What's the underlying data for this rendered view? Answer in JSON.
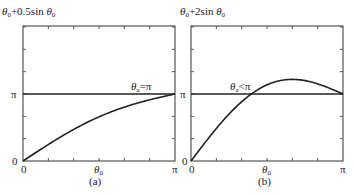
{
  "chart_data": [
    {
      "type": "line",
      "panel_label": "(a)",
      "title": "θ0+0.5sin θ0",
      "xlabel": "θ0",
      "x_tick_labels": [
        "0",
        "π"
      ],
      "y_tick_labels": [
        "0",
        "π"
      ],
      "xlim": [
        0,
        3.14159
      ],
      "ylim": [
        0,
        3.14159
      ],
      "series": [
        {
          "name": "θ0+0.5sin θ0",
          "function": "x + 0.5*sin(x)",
          "x": [
            0,
            0.3927,
            0.7854,
            1.1781,
            1.5708,
            1.9635,
            2.3562,
            2.7489,
            3.1416
          ],
          "values": [
            0,
            0.584,
            1.139,
            1.64,
            2.071,
            2.426,
            2.71,
            2.94,
            3.142
          ]
        },
        {
          "name": "π",
          "function": "pi",
          "x": [
            0,
            3.1416
          ],
          "values": [
            3.1416,
            3.1416
          ]
        }
      ],
      "annotations": [
        {
          "text": "θa=π",
          "x": 2.85,
          "y": 3.1416
        }
      ]
    },
    {
      "type": "line",
      "panel_label": "(b)",
      "title": "θ0+2sin θ0",
      "xlabel": "θ0",
      "x_tick_labels": [
        "0",
        "π"
      ],
      "y_tick_labels": [
        "0",
        "π"
      ],
      "xlim": [
        0,
        3.14159
      ],
      "ylim": [
        0,
        3.14159
      ],
      "series": [
        {
          "name": "θ0+2sin θ0",
          "function": "x + 2*sin(x)",
          "x": [
            0,
            0.3927,
            0.7854,
            1.1781,
            1.5708,
            1.9635,
            2.3562,
            2.7489,
            3.1416
          ],
          "values": [
            0,
            1.158,
            2.2,
            3.026,
            3.571,
            3.811,
            3.77,
            3.514,
            3.142
          ]
        },
        {
          "name": "π",
          "function": "pi",
          "x": [
            0,
            3.1416
          ],
          "values": [
            3.1416,
            3.1416
          ]
        }
      ],
      "annotations": [
        {
          "text": "θa<π",
          "x": 1.08,
          "y": 3.1416
        }
      ]
    }
  ],
  "panels": [
    {
      "ylabel_main": "θ",
      "ylabel_sub": "0",
      "ylabel_rest": "+0.5sin ",
      "ylabel_main2": "θ",
      "ylabel_sub2": "0",
      "annotation_main": "θ",
      "annotation_sub": "a",
      "annotation_rest": "=π",
      "x0": "0",
      "xpi": "π",
      "y0": "0",
      "ypi": "π",
      "xlabel_main": "θ",
      "xlabel_sub": "0",
      "caption": "(a)"
    },
    {
      "ylabel_main": "θ",
      "ylabel_sub": "0",
      "ylabel_rest": "+2sin ",
      "ylabel_main2": "θ",
      "ylabel_sub2": "0",
      "annotation_main": "θ",
      "annotation_sub": "a",
      "annotation_rest": "<π",
      "x0": "0",
      "xpi": "π",
      "y0": "0",
      "ypi": "π",
      "xlabel_main": "θ",
      "xlabel_sub": "0",
      "caption": "(b)"
    }
  ]
}
